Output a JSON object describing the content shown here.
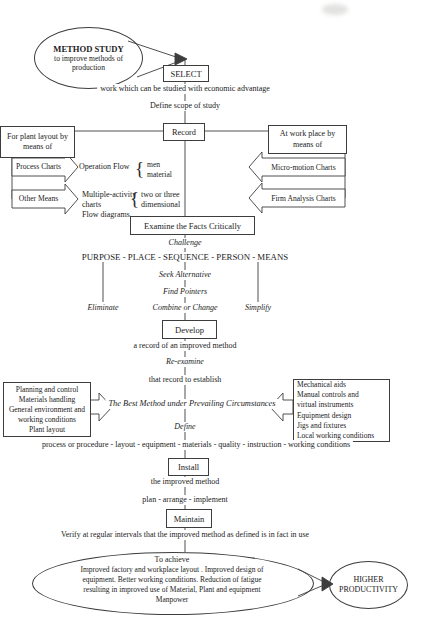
{
  "top": {
    "ellipse_title": "METHOD STUDY",
    "ellipse_subtitle": "to improve methods of\nproduction",
    "select_label": "SELECT",
    "select_note": "work which can be studied with economic advantage",
    "define_scope": "Define scope of study",
    "record_label": "Record"
  },
  "plant_layout_branch": {
    "header": "For plant layout by\nmeans of",
    "arrow1_label": "Process Charts",
    "operation_flow": "Operation Flow",
    "brace1": "{",
    "men_material": "men\nmaterial",
    "arrow2_label": "Other Means",
    "multiple_activity": "Multiple-activity\ncharts",
    "brace2": "{",
    "two_or_three": "two or three\ndimensional",
    "flow_diagrams": "Flow diagrams"
  },
  "work_place_branch": {
    "header": "At work place by\nmeans of",
    "arrow1_label": "Micro-motion Charts",
    "arrow2_label": "Firm Analysis Charts"
  },
  "examine": {
    "box_label": "Examine the Facts Critically",
    "challenge": "Challenge",
    "questions": "PURPOSE - PLACE - SEQUENCE - PERSON - MEANS",
    "seek_alternative": "Seek Alternative",
    "find_pointers": "Find Pointers",
    "eliminate": "Eliminate",
    "combine_or_change": "Combine or Change",
    "simplify": "Simplify"
  },
  "develop": {
    "box_label": "Develop",
    "note": "a record of an improved method",
    "re_examine": "Re-examine",
    "establish": "that record to establish",
    "left_box": "Planning and control\nMaterials handling\nGeneral environment and\nworking conditions\nPlant layout",
    "best_method": "The Best Method under Prevailing Circumstances",
    "right_box": "Mechanical aids\nManual controls and\nvirtual instruments\nEquipment design\nJigs and fixtures\nLocal working conditions",
    "define": "Define",
    "define_note": "process or procedure - layout - equipment - materials - quality - instruction - working conditions"
  },
  "install": {
    "box_label": "Install",
    "note": "the improved method",
    "plan": "plan - arrange - implement"
  },
  "maintain": {
    "box_label": "Maintain",
    "verify": "Verify at regular intervals that the improved method as defined is in fact in use"
  },
  "outcome": {
    "to_achieve": "To achieve",
    "achievements": "Improved factory and workplace layout .  Improved design of\nequipment.  Better working conditions.  Reduction of fatigue\nresulting in improved use of Material, Plant and equipment\nManpower",
    "higher_productivity": "HIGHER\nPRODUCTIVITY"
  }
}
